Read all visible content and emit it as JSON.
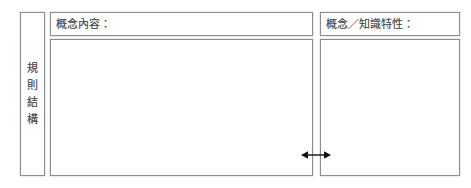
{
  "form": {
    "title": "規則結構表",
    "row_label": "規\n則\n結\n構",
    "panels": [
      {
        "id": "concept-content",
        "header_label": "概念內容：",
        "body_value": ""
      },
      {
        "id": "concept-attribute",
        "header_label": "概念／知識特性：",
        "body_value": ""
      }
    ],
    "annotations": [
      {
        "id": "width-adjust-arrow",
        "icon": "double-headed-horizontal-arrow-icon",
        "label": ""
      }
    ],
    "colors": {
      "line": "#8d8d8d",
      "text": "#4a4a4a",
      "background": "#ffffff",
      "arrow": "#111111"
    }
  }
}
